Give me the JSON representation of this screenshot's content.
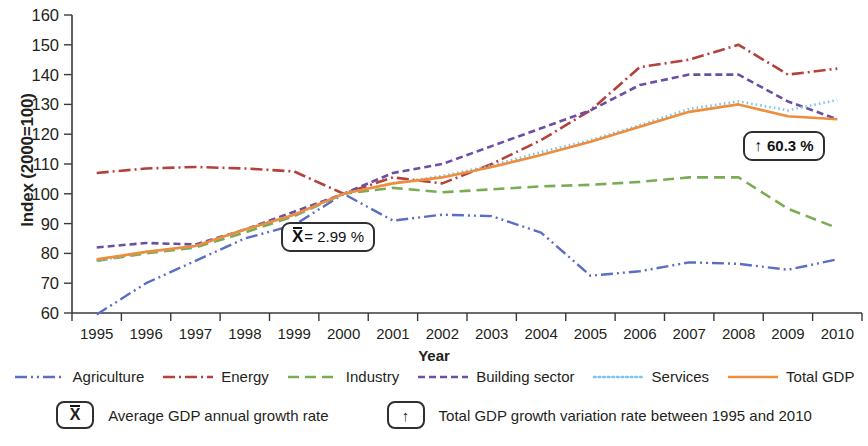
{
  "axes": {
    "y_title": "Index (2000=100)",
    "x_title": "Year",
    "y_ticks": [
      "60",
      "70",
      "80",
      "90",
      "100",
      "110",
      "120",
      "130",
      "140",
      "150",
      "160"
    ],
    "x_ticks": [
      "1995",
      "1996",
      "1997",
      "1998",
      "1999",
      "2000",
      "2001",
      "2002",
      "2003",
      "2004",
      "2005",
      "2006",
      "2007",
      "2008",
      "2009",
      "2010"
    ]
  },
  "annotations": {
    "mean_symbol": "X",
    "mean_text": "= 2.99 %",
    "mean_full": "X̄ = 2.99 %",
    "growth_arrow": "↑",
    "growth_text": "60.3 %"
  },
  "legend": {
    "items": [
      {
        "label": "Agriculture",
        "color": "#5b6ec4",
        "style": "dash-dot-dot"
      },
      {
        "label": "Energy",
        "color": "#b5413b",
        "style": "dash-dot"
      },
      {
        "label": "Industry",
        "color": "#7aab55",
        "style": "long-dash"
      },
      {
        "label": "Building sector",
        "color": "#6a4fa3",
        "style": "dash"
      },
      {
        "label": "Services",
        "color": "#7fc4ea",
        "style": "dotted"
      },
      {
        "label": "Total GDP",
        "color": "#ee8d3c",
        "style": "solid"
      }
    ]
  },
  "key": {
    "items": [
      {
        "symbol": "X",
        "symbol_kind": "mean",
        "text": "Average GDP annual growth rate"
      },
      {
        "symbol": "↑",
        "symbol_kind": "arrow",
        "text": "Total GDP growth variation rate between 1995 and 2010"
      }
    ]
  },
  "colors": {
    "agriculture": "#5b6ec4",
    "energy": "#b5413b",
    "industry": "#7aab55",
    "building": "#6a4fa3",
    "services": "#7fc4ea",
    "total_gdp": "#ee8d3c",
    "axis": "#3a3a3a",
    "text": "#231f20"
  },
  "chart_data": {
    "type": "line",
    "title": "",
    "xlabel": "Year",
    "ylabel": "Index (2000=100)",
    "xlim": [
      1995,
      2010
    ],
    "ylim": [
      60,
      160
    ],
    "grid": false,
    "legend_position": "bottom",
    "categories": [
      1995,
      1996,
      1997,
      1998,
      1999,
      2000,
      2001,
      2002,
      2003,
      2004,
      2005,
      2006,
      2007,
      2008,
      2009,
      2010
    ],
    "series": [
      {
        "name": "Agriculture",
        "color": "#5b6ec4",
        "style": "dash-dot-dot",
        "values": [
          59.5,
          70.0,
          77.5,
          85.0,
          89.5,
          100.0,
          91.0,
          93.0,
          92.5,
          87.0,
          72.5,
          74.0,
          77.0,
          76.5,
          74.5,
          78.0
        ]
      },
      {
        "name": "Energy",
        "color": "#b5413b",
        "style": "dash-dot",
        "values": [
          107.0,
          108.5,
          109.0,
          108.5,
          107.5,
          100.0,
          105.5,
          103.5,
          110.0,
          118.0,
          128.0,
          142.5,
          145.0,
          150.0,
          140.0,
          142.0
        ]
      },
      {
        "name": "Industry",
        "color": "#7aab55",
        "style": "long-dash",
        "values": [
          77.5,
          80.0,
          82.0,
          87.0,
          92.5,
          100.0,
          102.0,
          100.5,
          101.5,
          102.5,
          103.0,
          104.0,
          105.5,
          105.5,
          95.0,
          88.5
        ]
      },
      {
        "name": "Building sector",
        "color": "#6a4fa3",
        "style": "dash",
        "values": [
          82.0,
          83.5,
          83.0,
          88.0,
          94.0,
          100.0,
          107.0,
          110.0,
          116.0,
          122.0,
          128.0,
          136.5,
          140.0,
          140.0,
          131.0,
          125.0
        ]
      },
      {
        "name": "Services",
        "color": "#7fc4ea",
        "style": "dotted",
        "values": [
          77.5,
          80.5,
          82.5,
          88.0,
          93.0,
          100.0,
          103.5,
          106.0,
          109.5,
          114.0,
          118.0,
          123.0,
          128.5,
          131.0,
          128.0,
          131.5
        ]
      },
      {
        "name": "Total GDP",
        "color": "#ee8d3c",
        "style": "solid",
        "values": [
          78.0,
          80.5,
          82.5,
          88.0,
          93.0,
          100.0,
          103.5,
          105.5,
          109.0,
          113.0,
          117.5,
          122.5,
          127.5,
          130.0,
          126.0,
          125.0
        ]
      }
    ]
  }
}
